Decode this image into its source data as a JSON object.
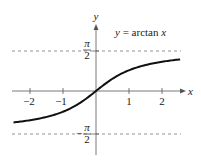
{
  "chart_data": {
    "type": "line",
    "title": "",
    "annotation": "y = arctan x",
    "function": "arctan",
    "xlabel": "x",
    "ylabel": "y",
    "xlim": [
      -2.5,
      2.55
    ],
    "ylim": [
      -2.0,
      2.4
    ],
    "x_ticks": [
      -2,
      -1,
      1,
      2
    ],
    "x_tick_labels": [
      "−2",
      "−1",
      "1",
      "2"
    ],
    "y_tick_labels": [
      {
        "value": 1.5708,
        "label": "π/2",
        "numerator": "π",
        "denominator": "2",
        "sign": ""
      },
      {
        "value": -1.5708,
        "label": "−π/2",
        "numerator": "π",
        "denominator": "2",
        "sign": "−"
      }
    ],
    "asymptotes": [
      {
        "y": 1.5708,
        "label": "π/2",
        "style": "dashed"
      },
      {
        "y": -1.5708,
        "label": "−π/2",
        "style": "dashed"
      }
    ],
    "series": [
      {
        "name": "y = arctan x",
        "x": [
          -2.5,
          -2.0,
          -1.5,
          -1.0,
          -0.5,
          0,
          0.5,
          1.0,
          1.5,
          2.0,
          2.55
        ],
        "y": [
          -1.19,
          -1.107,
          -0.983,
          -0.785,
          -0.464,
          0,
          0.464,
          0.785,
          0.983,
          1.107,
          1.197
        ]
      }
    ],
    "grid": false,
    "legend": "none"
  },
  "labels": {
    "equation_prefix": "y = arctan ",
    "equation_var": "x",
    "x_axis": "x",
    "y_axis": "y",
    "x_tick_m2": "−2",
    "x_tick_m1": "−1",
    "x_tick_1": "1",
    "x_tick_2": "2",
    "pi": "π",
    "two": "2",
    "minus": "−"
  }
}
